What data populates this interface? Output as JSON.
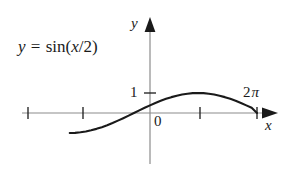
{
  "figure": {
    "background_color": "#ffffff",
    "axis_color": "#8c8c8c",
    "curve_color": "#1a1a1a",
    "text_color": "#1a1a1a"
  },
  "labels": {
    "equation": {
      "lhs": "y",
      "equals": " = ",
      "function": "sin(",
      "argument_numerator": "x",
      "argument_slash": "/",
      "argument_denominator": "2",
      "close_paren": ")",
      "full_text": "y = sin(x/2)"
    },
    "y_axis": "y",
    "x_axis": "x",
    "origin": "0",
    "y_tick_one": "1",
    "x_tick_twopi_coefficient": "2",
    "x_tick_twopi_symbol": "π",
    "x_tick_twopi_full": "2π"
  },
  "chart_data": {
    "type": "line",
    "title": "y = sin(x/2)",
    "xlabel": "x",
    "ylabel": "y",
    "function": "y = sin(x/2)",
    "grid": false,
    "legend": null,
    "xlim": [
      -4.71238898,
      7.33038286
    ],
    "ylim": [
      -1.85,
      2.6
    ],
    "x_ticks": [
      -4.71238898,
      -3.14159265,
      3.14159265,
      6.28318531
    ],
    "x_tick_labels": [
      "",
      "",
      "",
      "2π"
    ],
    "y_ticks": [
      1
    ],
    "y_tick_labels": [
      "1"
    ],
    "annotations": [
      {
        "text": "y = sin(x/2)",
        "x": -3.9,
        "y": 2.0
      },
      {
        "text": "0",
        "x": 0.22,
        "y": -0.38
      },
      {
        "text": "2π",
        "x": 5.95,
        "y": 1.28
      }
    ],
    "x": [
      -4.71238898,
      -4.39822972,
      -4.08407045,
      -3.76991118,
      -3.45575192,
      -3.14159265,
      -2.82743339,
      -2.51327412,
      -2.19911486,
      -1.88495559,
      -1.57079633,
      -1.25663706,
      -0.9424778,
      -0.62831853,
      -0.31415927,
      0.0,
      0.31415927,
      0.62831853,
      0.9424778,
      1.25663706,
      1.57079633,
      1.88495559,
      2.19911486,
      2.51327412,
      2.82743339,
      3.14159265,
      3.45575192,
      3.76991118,
      4.08407045,
      4.39822972,
      4.71238898,
      5.02654825,
      5.34070751,
      5.65486678,
      5.96902604,
      6.28318531
    ],
    "y": [
      -1.0,
      -0.99144486,
      -0.96592583,
      -0.92387953,
      -0.8660254,
      -0.79335334,
      -0.70710678,
      -0.60876143,
      -0.5,
      -0.38268343,
      -0.25881905,
      -0.13052619,
      0.0,
      0.13052619,
      0.25881905,
      0.38268343,
      0.5,
      0.60876143,
      0.70710678,
      0.79335334,
      0.8660254,
      0.92387953,
      0.96592583,
      0.99144486,
      1.0,
      0.99144486,
      0.96592583,
      0.92387953,
      0.8660254,
      0.79335334,
      0.70710678,
      0.60876143,
      0.5,
      0.38268343,
      0.25881905,
      0.0
    ]
  },
  "geometry": {
    "y_axis_x_px": 150,
    "x_axis_y_px": 113,
    "x_axis_left_px": 22,
    "x_axis_arrow_tip_px": 277,
    "y_axis_top_arrow_px": 20,
    "y_axis_bottom_px": 164,
    "unit_y_px": 20,
    "x_tick_positions_px": [
      28,
      83,
      200,
      257
    ],
    "y_tick_position_px": 93
  }
}
